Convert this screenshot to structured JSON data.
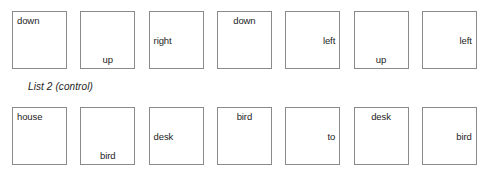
{
  "worksheet": {
    "label": "List 2 (control)",
    "box_pitch_px": 68.3,
    "rows": [
      {
        "name": "row-top",
        "cells": [
          {
            "word": "down",
            "h_align": "left",
            "v_align": "top"
          },
          {
            "word": "up",
            "h_align": "center",
            "v_align": "bottom"
          },
          {
            "word": "right",
            "h_align": "left",
            "v_align": "middle"
          },
          {
            "word": "down",
            "h_align": "center",
            "v_align": "top"
          },
          {
            "word": "left",
            "h_align": "right",
            "v_align": "middle"
          },
          {
            "word": "up",
            "h_align": "center",
            "v_align": "bottom"
          },
          {
            "word": "left",
            "h_align": "right",
            "v_align": "middle"
          }
        ]
      },
      {
        "name": "row-bottom",
        "cells": [
          {
            "word": "house",
            "h_align": "left",
            "v_align": "top"
          },
          {
            "word": "bird",
            "h_align": "center",
            "v_align": "bottom"
          },
          {
            "word": "desk",
            "h_align": "left",
            "v_align": "middle"
          },
          {
            "word": "bird",
            "h_align": "center",
            "v_align": "top"
          },
          {
            "word": "to",
            "h_align": "right",
            "v_align": "middle"
          },
          {
            "word": "desk",
            "h_align": "center",
            "v_align": "top"
          },
          {
            "word": "bird",
            "h_align": "right",
            "v_align": "middle"
          }
        ]
      }
    ],
    "colors": {
      "box_border": "#8a8a8a",
      "text": "#1d1d1d",
      "background": "#ffffff"
    }
  }
}
